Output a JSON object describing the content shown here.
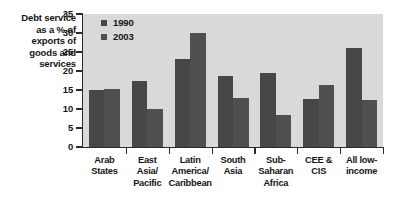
{
  "chart_data": {
    "type": "bar",
    "title": "",
    "ylabel": "Debt service as a % of exports of goods and services",
    "xlabel": "",
    "ylim": [
      0,
      35
    ],
    "yticks": [
      0,
      5,
      10,
      15,
      20,
      25,
      30,
      35
    ],
    "ytick_labels": [
      "0",
      "5",
      "10",
      "15",
      "20",
      "25",
      "30",
      "35"
    ],
    "grid": false,
    "legend_position": "top-left",
    "categories": [
      "Arab States",
      "East Asia/ Pacific",
      "Latin America/ Caribbean",
      "South Asia",
      "Sub- Saharan Africa",
      "CEE & CIS",
      "All low- income"
    ],
    "series": [
      {
        "name": "1990",
        "color": "#474747",
        "values": [
          14.9,
          17.5,
          23.1,
          18.8,
          19.6,
          12.7,
          26.0
        ]
      },
      {
        "name": "2003",
        "color": "#4f4f4f",
        "values": [
          15.3,
          9.9,
          30.0,
          12.8,
          8.4,
          16.2,
          12.3
        ]
      }
    ]
  },
  "axis": {
    "y_title_lines": [
      "Debt service",
      "as a % of",
      "exports of",
      "goods and",
      "services"
    ]
  },
  "category_labels": [
    [
      "Arab",
      "States"
    ],
    [
      "East",
      "Asia/",
      "Pacific"
    ],
    [
      "Latin",
      "America/",
      "Caribbean"
    ],
    [
      "South",
      "Asia"
    ],
    [
      "Sub-",
      "Saharan",
      "Africa"
    ],
    [
      "CEE &",
      "CIS"
    ],
    [
      "All low-",
      "income"
    ]
  ],
  "colors": {
    "plot_background": "#d9d9d9",
    "axis": "#2b2b2b",
    "text": "#151515",
    "series_1990": "#474747",
    "series_2003": "#4f4f4f"
  }
}
